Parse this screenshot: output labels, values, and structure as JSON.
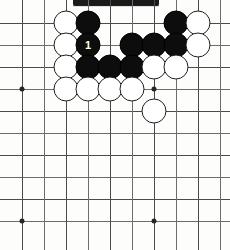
{
  "diagram": {
    "board": {
      "columns": 10,
      "rows": 10,
      "grid_spacing_px": 22,
      "origin_x_px": 22,
      "origin_y_px": 23,
      "line_color": "#4a4a4a",
      "background_color": "#fdfdfc"
    },
    "star_points": [
      {
        "col": 0,
        "row": 3
      },
      {
        "col": 6,
        "row": 3
      },
      {
        "col": 0,
        "row": 9
      },
      {
        "col": 6,
        "row": 9
      }
    ],
    "stone_colors": {
      "black": "#0d0d0d",
      "white": "#ffffff",
      "white_outline": "#1f1f1f"
    },
    "stones": [
      {
        "id": "w-c2r0",
        "color": "white",
        "col": 2,
        "row": 0,
        "label": ""
      },
      {
        "id": "b-c3r0",
        "color": "black",
        "col": 3,
        "row": 0,
        "label": ""
      },
      {
        "id": "b-c7r0",
        "color": "black",
        "col": 7,
        "row": 0,
        "label": ""
      },
      {
        "id": "w-c8r0",
        "color": "white",
        "col": 8,
        "row": 0,
        "label": ""
      },
      {
        "id": "w-c2r1",
        "color": "white",
        "col": 2,
        "row": 1,
        "label": ""
      },
      {
        "id": "b-c3r1",
        "color": "black",
        "col": 3,
        "row": 1,
        "label": "1"
      },
      {
        "id": "b-c5r1",
        "color": "black",
        "col": 5,
        "row": 1,
        "label": ""
      },
      {
        "id": "b-c6r1",
        "color": "black",
        "col": 6,
        "row": 1,
        "label": ""
      },
      {
        "id": "b-c7r1",
        "color": "black",
        "col": 7,
        "row": 1,
        "label": ""
      },
      {
        "id": "w-c8r1",
        "color": "white",
        "col": 8,
        "row": 1,
        "label": ""
      },
      {
        "id": "w-c2r2",
        "color": "white",
        "col": 2,
        "row": 2,
        "label": ""
      },
      {
        "id": "b-c3r2",
        "color": "black",
        "col": 3,
        "row": 2,
        "label": ""
      },
      {
        "id": "b-c4r2",
        "color": "black",
        "col": 4,
        "row": 2,
        "label": ""
      },
      {
        "id": "b-c5r2",
        "color": "black",
        "col": 5,
        "row": 2,
        "label": ""
      },
      {
        "id": "w-c6r2",
        "color": "white",
        "col": 6,
        "row": 2,
        "label": ""
      },
      {
        "id": "w-c7r2",
        "color": "white",
        "col": 7,
        "row": 2,
        "label": ""
      },
      {
        "id": "w-c2r3",
        "color": "white",
        "col": 2,
        "row": 3,
        "label": ""
      },
      {
        "id": "w-c3r3",
        "color": "white",
        "col": 3,
        "row": 3,
        "label": ""
      },
      {
        "id": "w-c4r3",
        "color": "white",
        "col": 4,
        "row": 3,
        "label": ""
      },
      {
        "id": "w-c5r3",
        "color": "white",
        "col": 5,
        "row": 3,
        "label": ""
      },
      {
        "id": "w-c6r4",
        "color": "white",
        "col": 6,
        "row": 4,
        "label": ""
      }
    ],
    "move_markers": [
      {
        "number": "1",
        "col": 3,
        "row": 1,
        "stone_color": "black"
      }
    ],
    "artifact": {
      "type": "scan-bar",
      "color": "#1a1a1a"
    }
  }
}
